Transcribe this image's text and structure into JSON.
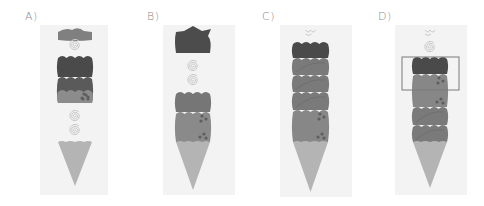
{
  "figure": {
    "panels": [
      {
        "id": "A",
        "label": "A)",
        "label_x": 25,
        "bg": [
          40,
          25,
          68,
          170
        ],
        "blocks": [
          {
            "kind": "wavy-cap",
            "y": 29,
            "h": 11,
            "color": "#808080"
          },
          {
            "kind": "spiral",
            "y": 45
          },
          {
            "kind": "bumpy",
            "y": 56,
            "h": 21,
            "color": "#4a4a4a"
          },
          {
            "kind": "bumpy",
            "y": 77,
            "h": 26,
            "color": "#5a5a5a"
          },
          {
            "kind": "bumpy-spots",
            "y": 90,
            "h": 13,
            "color": "#8c8c8c"
          },
          {
            "kind": "spiral",
            "y": 116
          },
          {
            "kind": "spiral",
            "y": 130
          },
          {
            "kind": "cone",
            "y": 142,
            "tip": 186
          }
        ],
        "column": [
          58,
          92
        ]
      },
      {
        "id": "B",
        "label": "B)",
        "label_x": 147,
        "bg": [
          163,
          25,
          72,
          170
        ],
        "blocks": [
          {
            "kind": "spiky-cap",
            "y": 28,
            "h": 25,
            "color": "#4c4c4c"
          },
          {
            "kind": "spiral",
            "y": 66
          },
          {
            "kind": "spiral",
            "y": 80
          },
          {
            "kind": "bumpy",
            "y": 92,
            "h": 20,
            "color": "#767676"
          },
          {
            "kind": "bumpy-spots",
            "y": 112,
            "h": 30,
            "color": "#8a8a8a"
          },
          {
            "kind": "cone",
            "y": 142,
            "tip": 190
          }
        ],
        "column": [
          176,
          210
        ]
      },
      {
        "id": "C",
        "label": "C)",
        "label_x": 262,
        "bg": [
          280,
          25,
          72,
          172
        ],
        "blocks": [
          {
            "kind": "squiggle",
            "y": 33
          },
          {
            "kind": "bumpy",
            "y": 42,
            "h": 16,
            "color": "#4a4a4a"
          },
          {
            "kind": "bumpy-stripe",
            "y": 58,
            "h": 17,
            "color": "#7a7a7a"
          },
          {
            "kind": "bumpy-stripe",
            "y": 75,
            "h": 17,
            "color": "#7a7a7a"
          },
          {
            "kind": "bumpy-stripe",
            "y": 92,
            "h": 18,
            "color": "#7a7a7a"
          },
          {
            "kind": "bumpy-spots",
            "y": 110,
            "h": 32,
            "color": "#878787"
          },
          {
            "kind": "cone",
            "y": 142,
            "tip": 192
          }
        ],
        "column": [
          293,
          328
        ]
      },
      {
        "id": "D",
        "label": "D)",
        "label_x": 378,
        "bg": [
          395,
          25,
          72,
          170
        ],
        "blocks": [
          {
            "kind": "squiggle",
            "y": 33
          },
          {
            "kind": "spiral",
            "y": 47
          },
          {
            "kind": "bumpy",
            "y": 57,
            "h": 17,
            "color": "#4a4a4a"
          },
          {
            "kind": "bumpy-spots",
            "y": 74,
            "h": 33,
            "color": "#878787"
          },
          {
            "kind": "bumpy-stripe",
            "y": 107,
            "h": 18,
            "color": "#7a7a7a"
          },
          {
            "kind": "bumpy-stripe",
            "y": 125,
            "h": 17,
            "color": "#7a7a7a"
          },
          {
            "kind": "cone",
            "y": 142,
            "tip": 188
          }
        ],
        "column": [
          413,
          447
        ],
        "highlight_box": [
          402,
          57,
          57,
          33
        ]
      }
    ],
    "colors": {
      "cone": "#b4b4b4",
      "spiral": "#c8c8c8",
      "spots": "#5e5e5e",
      "box_stroke": "#7a7a7a",
      "label": "#8a8a8a"
    }
  }
}
